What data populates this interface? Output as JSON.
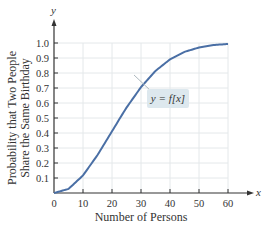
{
  "chart_data": {
    "type": "line",
    "title": "",
    "xlabel": "Number of Persons",
    "ylabel_line1": "Probability that Two People",
    "ylabel_line2": "Share the Same Birthday",
    "x_axis_var": "x",
    "y_axis_var": "y",
    "xlim": [
      0,
      60
    ],
    "ylim": [
      0,
      1.0
    ],
    "grid": true,
    "x_ticks": [
      "0",
      "10",
      "20",
      "30",
      "40",
      "50",
      "60"
    ],
    "y_ticks": [
      "0.1",
      "0.2",
      "0.3",
      "0.4",
      "0.5",
      "0.6",
      "0.7",
      "0.8",
      "0.9",
      "1.0"
    ],
    "series": [
      {
        "name": "y = f(x)",
        "x": [
          0,
          5,
          10,
          15,
          20,
          23,
          25,
          30,
          35,
          40,
          45,
          50,
          55,
          60
        ],
        "values": [
          0,
          0.027,
          0.117,
          0.253,
          0.411,
          0.507,
          0.569,
          0.706,
          0.814,
          0.891,
          0.941,
          0.97,
          0.986,
          0.994
        ]
      }
    ],
    "annotation": {
      "text": "y = f[x]",
      "points_to_x": 28
    },
    "colors": {
      "curve": "#4a6fa5",
      "grid": "#e4e8ea",
      "axis": "#333333",
      "annotation_bg": "#dde8ee"
    }
  }
}
